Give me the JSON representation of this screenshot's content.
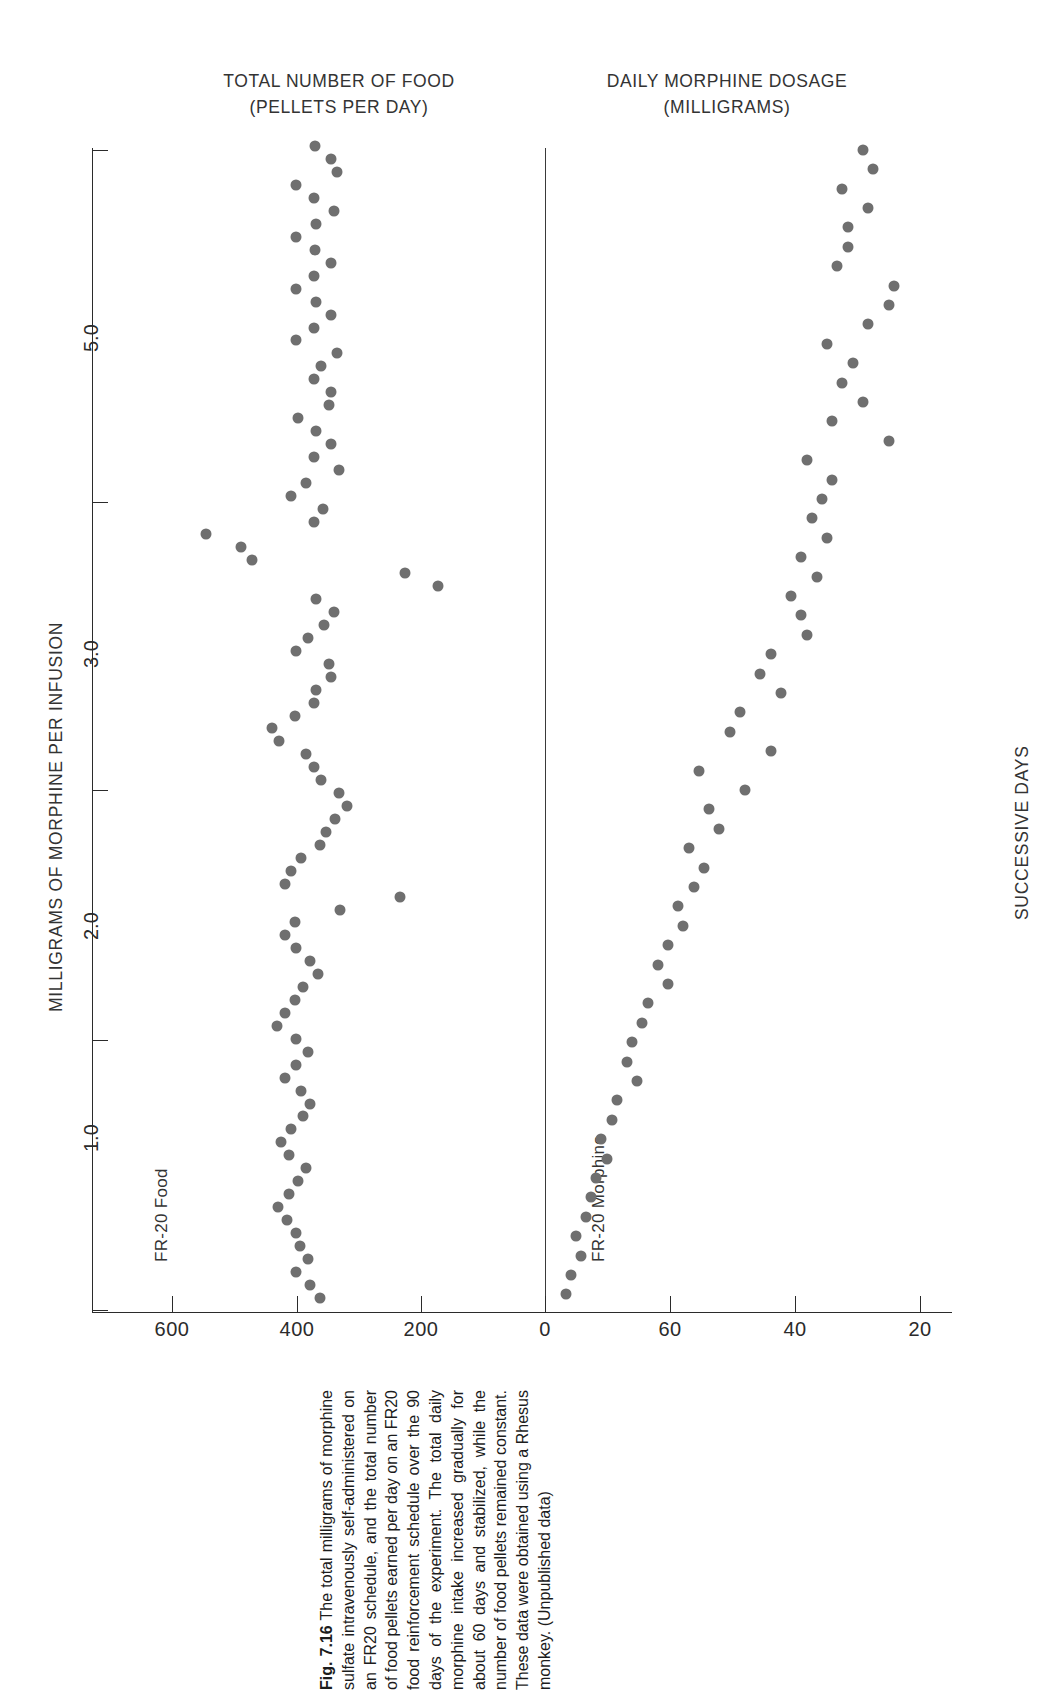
{
  "panels": {
    "left": {
      "title": "TOTAL NUMBER OF FOOD\n(PELLETS PER DAY)",
      "series_label": "FR-20 Food"
    },
    "right": {
      "title": "DAILY MORPHINE DOSAGE\n(MILLIGRAMS)",
      "series_label": "FR-20 Morphine"
    }
  },
  "axes": {
    "left_label": "MILLIGRAMS OF MORPHINE PER INFUSION",
    "right_label": "SUCCESSIVE DAYS",
    "x_ticks_left": [
      "600",
      "400",
      "200",
      "0"
    ],
    "x_ticks_right": [
      "60",
      "40",
      "20"
    ],
    "y_ticks": [
      "5.0",
      "3.0",
      "2.0",
      "1.0"
    ]
  },
  "caption": {
    "number": "Fig. 7.16",
    "text": "The total milligrams of morphine sulfate intravenously self-administered on an FR20 schedule, and the total number of food pellets earned per day on an FR20 food reinforcement schedule over the 90 days of the experiment. The total daily morphine intake increased gradually for about 60 days and stabilized, while the number of food pellets remained constant. These data were obtained using a Rhesus monkey. (Unpublished data)"
  },
  "colors": {
    "point": "#6f6f6f",
    "axis": "#2b2b2b",
    "text": "#333333"
  },
  "chart_data": {
    "type": "scatter",
    "orientation": "horizontal",
    "shared_y": {
      "label": "SUCCESSIVE DAYS (days 1-90, top to bottom)",
      "secondary_label": "MILLIGRAMS OF MORPHINE PER INFUSION",
      "tick_labels": [
        "5.0",
        "3.0",
        "2.0",
        "1.0"
      ],
      "tick_values": [
        5.0,
        3.0,
        2.0,
        1.0
      ],
      "grid": false
    },
    "series": [
      {
        "name": "FR-20 Food",
        "panel": "left",
        "xlabel": "TOTAL NUMBER OF FOOD (PELLETS PER DAY)",
        "xlim": [
          700,
          0
        ],
        "xticks": [
          600,
          400,
          200,
          0
        ],
        "values": [
          370,
          345,
          335,
          400,
          372,
          340,
          368,
          400,
          370,
          345,
          372,
          400,
          368,
          345,
          372,
          400,
          335,
          360,
          372,
          345,
          348,
          398,
          368,
          345,
          372,
          332,
          385,
          408,
          358,
          372,
          545,
          490,
          472,
          225,
          172,
          368,
          340,
          355,
          382,
          400,
          348,
          345,
          368,
          372,
          402,
          440,
          428,
          385,
          372,
          360,
          332,
          318,
          338,
          352,
          362,
          392,
          408,
          418,
          234,
          330,
          402,
          418,
          400,
          378,
          365,
          390,
          402,
          418,
          432,
          400,
          382,
          400,
          418,
          392,
          378,
          390,
          408,
          425,
          412,
          385,
          398,
          412,
          430,
          415,
          400,
          395,
          382,
          400,
          378,
          362
        ]
      },
      {
        "name": "FR-20 Morphine",
        "panel": "right",
        "xlabel": "DAILY MORPHINE DOSAGE (MILLIGRAMS)",
        "xlim": [
          0,
          78
        ],
        "xticks": [
          0,
          60,
          40,
          20
        ],
        "values": [
          62,
          64,
          58,
          63,
          59,
          59,
          57,
          68,
          67,
          63,
          55,
          60,
          58,
          62,
          56,
          67,
          51,
          56,
          54,
          52,
          55,
          50,
          53,
          48,
          50,
          51,
          44,
          42,
          46,
          38,
          36,
          44,
          30,
          39,
          32,
          34,
          28,
          31,
          29,
          26,
          27,
          24,
          22,
          24,
          20,
          19,
          17,
          16,
          18,
          14,
          13,
          11,
          12,
          10,
          9,
          8,
          6,
          7,
          5,
          4
        ]
      }
    ],
    "annotations": [
      "Morphine intake rises gradually over about 60 days then stabilizes",
      "Food pellet intake remains approximately constant near 380 pellets/day"
    ]
  }
}
